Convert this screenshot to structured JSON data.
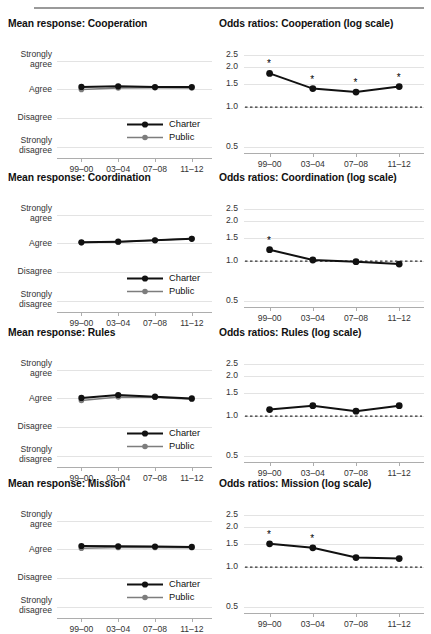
{
  "figure": {
    "columns": [
      "Mean response",
      "Odds ratios"
    ],
    "x_categories": [
      "99–00",
      "03–04",
      "07–08",
      "11–12"
    ],
    "series_names": [
      "Charter",
      "Public"
    ],
    "colors": {
      "charter": "#111111",
      "public": "#7d7d7d",
      "grid": "#e3e3e3",
      "axis": "#adadad",
      "reference_line": "#000000",
      "rule": "#9a9a9a"
    },
    "left_y_labels": [
      "Strongly agree",
      "Agree",
      "Disagree",
      "Strongly disagree"
    ],
    "left_y_label_lines": [
      [
        "Strongly",
        "agree"
      ],
      [
        "Agree"
      ],
      [
        "Disagree"
      ],
      [
        "Strongly",
        "disagree"
      ]
    ],
    "right_y_ticks": [
      "2.5",
      "2.0",
      "1.5",
      "1.0",
      "0.5"
    ],
    "legend": {
      "charter": "Charter",
      "public": "Public"
    }
  },
  "chart_data": [
    {
      "type": "line",
      "title": "Mean response: Cooperation",
      "panel": "left",
      "row": 0,
      "xlabel": "",
      "ylabel": "",
      "categories": [
        "99–00",
        "03–04",
        "07–08",
        "11–12"
      ],
      "ytick_labels": [
        "Strongly agree",
        "Agree",
        "Disagree",
        "Strongly disagree"
      ],
      "ytick_values": [
        4,
        3,
        2,
        1
      ],
      "ylim": [
        0.62,
        4.3
      ],
      "grid": true,
      "legend_position": "bottom-right",
      "series": [
        {
          "name": "Charter",
          "values": [
            3.09,
            3.11,
            3.08,
            3.08
          ]
        },
        {
          "name": "Public",
          "values": [
            3.0,
            3.05,
            3.06,
            3.05
          ]
        }
      ]
    },
    {
      "type": "line",
      "title": "Odds ratios: Cooperation (log scale)",
      "panel": "right",
      "row": 0,
      "xlabel": "",
      "ylabel": "",
      "categories": [
        "99–00",
        "03–04",
        "07–08",
        "11–12"
      ],
      "ytick_labels": [
        "2.5",
        "2.0",
        "1.5",
        "1.0",
        "0.5"
      ],
      "ytick_values": [
        2.5,
        2.0,
        1.5,
        1.0,
        0.5
      ],
      "ylim": [
        0.45,
        2.8
      ],
      "yscale": "log",
      "grid": true,
      "reference_line": 1.0,
      "series": [
        {
          "name": "Odds ratio",
          "values": [
            1.8,
            1.38,
            1.3,
            1.43
          ]
        }
      ],
      "significance": [
        true,
        true,
        true,
        true
      ],
      "significance_marker": "*"
    },
    {
      "type": "line",
      "title": "Mean response: Coordination",
      "panel": "left",
      "row": 1,
      "xlabel": "",
      "ylabel": "",
      "categories": [
        "99–00",
        "03–04",
        "07–08",
        "11–12"
      ],
      "ytick_labels": [
        "Strongly agree",
        "Agree",
        "Disagree",
        "Strongly disagree"
      ],
      "ytick_values": [
        4,
        3,
        2,
        1
      ],
      "ylim": [
        0.62,
        4.3
      ],
      "grid": true,
      "legend_position": "bottom-right",
      "series": [
        {
          "name": "Charter",
          "values": [
            3.04,
            3.06,
            3.11,
            3.16
          ]
        },
        {
          "name": "Public",
          "values": [
            3.03,
            3.05,
            3.11,
            3.17
          ]
        }
      ]
    },
    {
      "type": "line",
      "title": "Odds ratios: Coordination (log scale)",
      "panel": "right",
      "row": 1,
      "xlabel": "",
      "ylabel": "",
      "categories": [
        "99–00",
        "03–04",
        "07–08",
        "11–12"
      ],
      "ytick_labels": [
        "2.5",
        "2.0",
        "1.5",
        "1.0",
        "0.5"
      ],
      "ytick_values": [
        2.5,
        2.0,
        1.5,
        1.0,
        0.5
      ],
      "ylim": [
        0.45,
        2.8
      ],
      "yscale": "log",
      "grid": true,
      "reference_line": 1.0,
      "series": [
        {
          "name": "Odds ratio",
          "values": [
            1.22,
            1.02,
            0.99,
            0.95
          ]
        }
      ],
      "significance": [
        true,
        false,
        false,
        false
      ],
      "significance_marker": "*"
    },
    {
      "type": "line",
      "title": "Mean response: Rules",
      "panel": "left",
      "row": 2,
      "xlabel": "",
      "ylabel": "",
      "categories": [
        "99–00",
        "03–04",
        "07–08",
        "11–12"
      ],
      "ytick_labels": [
        "Strongly agree",
        "Agree",
        "Disagree",
        "Strongly disagree"
      ],
      "ytick_values": [
        4,
        3,
        2,
        1
      ],
      "ylim": [
        0.62,
        4.3
      ],
      "grid": true,
      "legend_position": "bottom-right",
      "series": [
        {
          "name": "Charter",
          "values": [
            3.02,
            3.12,
            3.06,
            3.0
          ]
        },
        {
          "name": "Public",
          "values": [
            2.93,
            3.05,
            3.04,
            2.97
          ]
        }
      ]
    },
    {
      "type": "line",
      "title": "Odds ratios: Rules (log scale)",
      "panel": "right",
      "row": 2,
      "xlabel": "",
      "ylabel": "",
      "categories": [
        "99–00",
        "03–04",
        "07–08",
        "11–12"
      ],
      "ytick_labels": [
        "2.5",
        "2.0",
        "1.5",
        "1.0",
        "0.5"
      ],
      "ytick_values": [
        2.5,
        2.0,
        1.5,
        1.0,
        0.5
      ],
      "ylim": [
        0.45,
        2.8
      ],
      "yscale": "log",
      "grid": true,
      "reference_line": 1.0,
      "series": [
        {
          "name": "Odds ratio",
          "values": [
            1.12,
            1.2,
            1.09,
            1.2
          ]
        }
      ],
      "significance": [
        false,
        false,
        false,
        false
      ],
      "significance_marker": "*"
    },
    {
      "type": "line",
      "title": "Mean response: Mission",
      "panel": "left",
      "row": 3,
      "xlabel": "",
      "ylabel": "",
      "categories": [
        "99–00",
        "03–04",
        "07–08",
        "11–12"
      ],
      "ytick_labels": [
        "Strongly agree",
        "Agree",
        "Disagree",
        "Strongly disagree"
      ],
      "ytick_values": [
        4,
        3,
        2,
        1
      ],
      "ylim": [
        0.62,
        4.3
      ],
      "grid": true,
      "legend_position": "bottom-right",
      "series": [
        {
          "name": "Charter",
          "values": [
            3.12,
            3.11,
            3.1,
            3.09
          ]
        },
        {
          "name": "Public",
          "values": [
            3.04,
            3.07,
            3.07,
            3.06
          ]
        }
      ]
    },
    {
      "type": "line",
      "title": "Odds ratios: Mission (log scale)",
      "panel": "right",
      "row": 3,
      "xlabel": "",
      "ylabel": "",
      "categories": [
        "99–00",
        "03–04",
        "07–08",
        "11–12"
      ],
      "ytick_labels": [
        "2.5",
        "2.0",
        "1.5",
        "1.0",
        "0.5"
      ],
      "ytick_values": [
        2.5,
        2.0,
        1.5,
        1.0,
        0.5
      ],
      "ylim": [
        0.45,
        2.8
      ],
      "yscale": "log",
      "grid": true,
      "reference_line": 1.0,
      "series": [
        {
          "name": "Odds ratio",
          "values": [
            1.5,
            1.4,
            1.18,
            1.16
          ]
        }
      ],
      "significance": [
        true,
        true,
        false,
        false
      ],
      "significance_marker": "*"
    }
  ]
}
